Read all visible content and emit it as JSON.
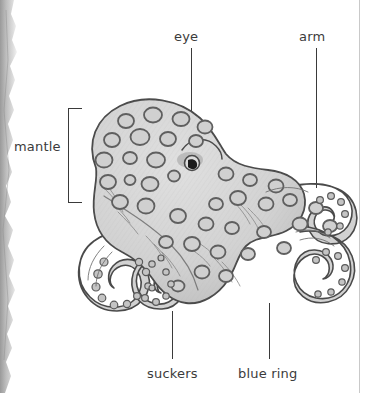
{
  "figure": {
    "medium": "scanned-textbook-page",
    "colors": {
      "body_fill": "#d6d6d6",
      "body_shade": "#c2c2c2",
      "outline": "#4a4a4a",
      "ring_outline": "#6b6b6b",
      "ring_fill": "#d0d0d0",
      "label_text": "#3b3b3b",
      "leader_line": "#3a3a3a",
      "page_edge": "#b8b8b8",
      "background": "#ffffff"
    }
  },
  "labels": [
    {
      "id": "mantle",
      "text": "mantle",
      "x": 14,
      "y": 139,
      "pointer": "bracket"
    },
    {
      "id": "eye",
      "text": "eye",
      "x": 174,
      "y": 29,
      "pointer": "line"
    },
    {
      "id": "arm",
      "text": "arm",
      "x": 299,
      "y": 29,
      "pointer": "line"
    },
    {
      "id": "suckers",
      "text": "suckers",
      "x": 147,
      "y": 366,
      "pointer": "line"
    },
    {
      "id": "blue-ring",
      "text": "blue ring",
      "x": 238,
      "y": 366,
      "pointer": "line"
    }
  ],
  "leaders": {
    "eye": {
      "x": 191,
      "top": 48,
      "height": 76
    },
    "arm": {
      "x": 316,
      "top": 48,
      "height": 140
    },
    "suckers": {
      "x": 172,
      "top": 311,
      "height": 48
    },
    "blue_ring": {
      "x": 269,
      "top": 303,
      "height": 56
    }
  },
  "bracket": {
    "x": 68,
    "y": 108,
    "width": 13,
    "height": 93
  }
}
